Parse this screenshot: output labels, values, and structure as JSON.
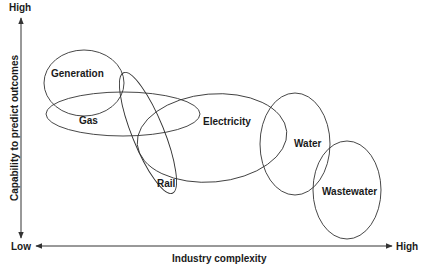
{
  "diagram": {
    "y_axis": {
      "label": "Capability to predict outcomes",
      "high": "High",
      "low": "Low"
    },
    "x_axis": {
      "label": "Industry complexity",
      "low": "Low",
      "high": "High"
    },
    "sectors": [
      {
        "name": "Generation",
        "cx": 84,
        "cy": 83,
        "rx": 40,
        "ry": 33,
        "rot": 0,
        "lx": 51,
        "ly": 77
      },
      {
        "name": "Gas",
        "cx": 123,
        "cy": 114,
        "rx": 77,
        "ry": 22,
        "rot": 0,
        "lx": 79,
        "ly": 124
      },
      {
        "name": "Rail",
        "cx": 148,
        "cy": 133,
        "rx": 65,
        "ry": 16,
        "rot": 68,
        "lx": 157,
        "ly": 187
      },
      {
        "name": "Electricity",
        "cx": 212,
        "cy": 138,
        "rx": 75,
        "ry": 44,
        "rot": -5,
        "lx": 203,
        "ly": 125
      },
      {
        "name": "Water",
        "cx": 295,
        "cy": 144,
        "rx": 35,
        "ry": 51,
        "rot": 0,
        "lx": 294,
        "ly": 147
      },
      {
        "name": "Wastewater",
        "cx": 347,
        "cy": 190,
        "rx": 34,
        "ry": 49,
        "rot": 0,
        "lx": 322,
        "ly": 195
      }
    ]
  }
}
